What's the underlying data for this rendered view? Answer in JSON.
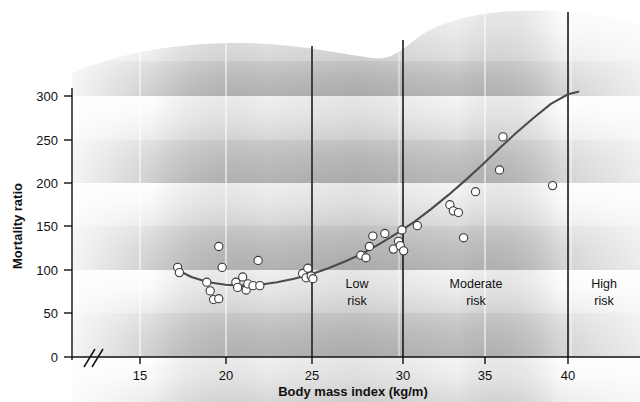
{
  "chart_data": {
    "type": "scatter",
    "title": "",
    "xlabel": "Body mass index (kg/m)",
    "ylabel": "Mortality ratio",
    "xlim": [
      13.3,
      41.5
    ],
    "ylim": [
      0,
      330
    ],
    "grid": true,
    "legend": "none",
    "axis_break_x": true,
    "xticks": [
      15,
      20,
      25,
      30,
      35,
      40
    ],
    "yticks": [
      0,
      50,
      100,
      150,
      200,
      250,
      300
    ],
    "x": [
      17.2,
      17.3,
      18.9,
      19.1,
      19.3,
      19.6,
      19.8,
      19.6,
      20.6,
      20.7,
      21.0,
      21.2,
      21.3,
      21.6,
      21.9,
      22.0,
      24.5,
      24.7,
      24.8,
      25.0,
      25.1,
      27.9,
      28.2,
      28.4,
      28.6,
      29.3,
      29.8,
      30.1,
      30.2,
      30.3,
      30.4,
      31.2,
      33.1,
      33.3,
      33.6,
      33.9,
      34.6,
      36.2,
      36.0,
      39.1
    ],
    "y": [
      103,
      97,
      86,
      76,
      66,
      127,
      103,
      67,
      86,
      80,
      92,
      77,
      84,
      82,
      111,
      82,
      96,
      91,
      102,
      93,
      90,
      117,
      114,
      127,
      139,
      142,
      124,
      133,
      128,
      146,
      122,
      151,
      175,
      168,
      166,
      137,
      190,
      253,
      215,
      197
    ],
    "curve": {
      "description": "fitted J-shaped mortality curve",
      "x": [
        17.2,
        18.0,
        19.0,
        20.0,
        21.0,
        22.0,
        23.0,
        24.0,
        25.0,
        26.0,
        27.0,
        28.0,
        29.0,
        30.0,
        31.0,
        32.0,
        33.0,
        34.0,
        35.0,
        36.0,
        37.0,
        38.0,
        39.0,
        40.0,
        40.6
      ],
      "y": [
        100,
        92,
        86,
        83,
        82,
        83,
        86,
        90,
        95,
        102,
        110,
        119,
        130,
        142,
        155,
        170,
        186,
        203,
        221,
        240,
        258,
        275,
        291,
        302,
        305
      ]
    },
    "regions": [
      {
        "label_line1": "Low",
        "label_line2": "risk",
        "x_start": 25,
        "x_end": 30
      },
      {
        "label_line1": "Moderate",
        "label_line2": "risk",
        "x_start": 30,
        "x_end": 40
      },
      {
        "label_line1": "High",
        "label_line2": "risk",
        "x_start": 40,
        "x_end": 41.5
      }
    ],
    "dividers": [
      25,
      30,
      40
    ]
  },
  "axis": {
    "y_title": "Mortality ratio",
    "x_title": "Body mass index (kg/m)",
    "y_tick_labels": [
      "300",
      "250",
      "200",
      "150",
      "100",
      "50",
      "0"
    ],
    "x_tick_labels": [
      "15",
      "20",
      "25",
      "30",
      "35",
      "40"
    ],
    "break_symbol": "//"
  },
  "regions_text": {
    "low_1": "Low",
    "low_2": "risk",
    "moderate_1": "Moderate",
    "moderate_2": "risk",
    "high_1": "High",
    "high_2": "risk"
  },
  "colors": {
    "curve": "#4a4a52",
    "point_fill": "#ffffff",
    "point_stroke": "#3a3a3a",
    "divider": "#1a1a1a",
    "text": "#111111",
    "band_light": "#f2f2f2",
    "band_dark": "#b9b9b9"
  }
}
